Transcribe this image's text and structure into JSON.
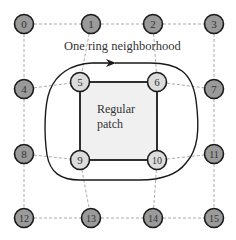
{
  "title": "One ring neighborhood",
  "patch_label_line1": "Regular",
  "patch_label_line2": "patch",
  "colors": {
    "outer_node_fill": "#9a9a9a",
    "inner_node_fill": "#dcdcdc",
    "patch_fill": "#f0f0f0",
    "stroke": "#1a1a1a",
    "grid_line": "#aaaaaa"
  },
  "nodes": [
    {
      "id": "0",
      "x": 24,
      "y": 24,
      "inner": false
    },
    {
      "id": "1",
      "x": 91,
      "y": 24,
      "inner": false
    },
    {
      "id": "2",
      "x": 153,
      "y": 24,
      "inner": false
    },
    {
      "id": "3",
      "x": 214,
      "y": 24,
      "inner": false
    },
    {
      "id": "4",
      "x": 24,
      "y": 89,
      "inner": false
    },
    {
      "id": "5",
      "x": 80,
      "y": 82,
      "inner": true
    },
    {
      "id": "6",
      "x": 157,
      "y": 82,
      "inner": true
    },
    {
      "id": "7",
      "x": 214,
      "y": 89,
      "inner": false
    },
    {
      "id": "8",
      "x": 24,
      "y": 154,
      "inner": false
    },
    {
      "id": "9",
      "x": 80,
      "y": 160,
      "inner": true
    },
    {
      "id": "10",
      "x": 157,
      "y": 160,
      "inner": true
    },
    {
      "id": "11",
      "x": 214,
      "y": 154,
      "inner": false
    },
    {
      "id": "12",
      "x": 24,
      "y": 218,
      "inner": false
    },
    {
      "id": "13",
      "x": 91,
      "y": 218,
      "inner": false
    },
    {
      "id": "14",
      "x": 153,
      "y": 218,
      "inner": false
    },
    {
      "id": "15",
      "x": 214,
      "y": 218,
      "inner": false
    }
  ],
  "grid_edges": [
    [
      0,
      1
    ],
    [
      1,
      2
    ],
    [
      2,
      3
    ],
    [
      4,
      5
    ],
    [
      6,
      7
    ],
    [
      8,
      9
    ],
    [
      10,
      11
    ],
    [
      12,
      13
    ],
    [
      13,
      14
    ],
    [
      14,
      15
    ],
    [
      0,
      4
    ],
    [
      4,
      8
    ],
    [
      8,
      12
    ],
    [
      1,
      5
    ],
    [
      5,
      9
    ],
    [
      9,
      13
    ],
    [
      2,
      6
    ],
    [
      6,
      10
    ],
    [
      10,
      14
    ],
    [
      3,
      7
    ],
    [
      7,
      11
    ],
    [
      11,
      15
    ]
  ]
}
